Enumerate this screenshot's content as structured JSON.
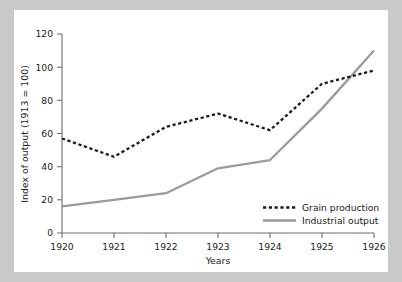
{
  "chart_data": {
    "type": "line",
    "title": "",
    "xlabel": "Years",
    "ylabel": "Index of output (1913 = 100)",
    "x": [
      1920,
      1921,
      1922,
      1923,
      1924,
      1925,
      1926
    ],
    "xticklabels": [
      "1920",
      "1921",
      "1922",
      "1923",
      "1924",
      "1925",
      "1926"
    ],
    "yticklabels": [
      "0",
      "20",
      "40",
      "60",
      "80",
      "100",
      "120"
    ],
    "yticks": [
      0,
      20,
      40,
      60,
      80,
      100,
      120
    ],
    "xlim": [
      1920,
      1926
    ],
    "ylim": [
      0,
      120
    ],
    "grid": false,
    "legend_position": "lower right",
    "series": [
      {
        "name": "Grain production",
        "values": [
          57,
          46,
          64,
          72,
          62,
          90,
          98
        ],
        "color": "#1c1c1c",
        "style": "dashed"
      },
      {
        "name": "Industrial output",
        "values": [
          16,
          20,
          24,
          39,
          44,
          75,
          110
        ],
        "color": "#9a9a9a",
        "style": "solid"
      }
    ]
  },
  "legend": {
    "entries": [
      {
        "label": "Grain production"
      },
      {
        "label": "Industrial output"
      }
    ]
  },
  "colors": {
    "page_background": "#c9c9c9",
    "panel_background": "#ffffff",
    "axis": "#6f6f6f",
    "grain": "#1c1c1c",
    "industrial": "#9a9a9a",
    "text": "#1a1a1a"
  }
}
